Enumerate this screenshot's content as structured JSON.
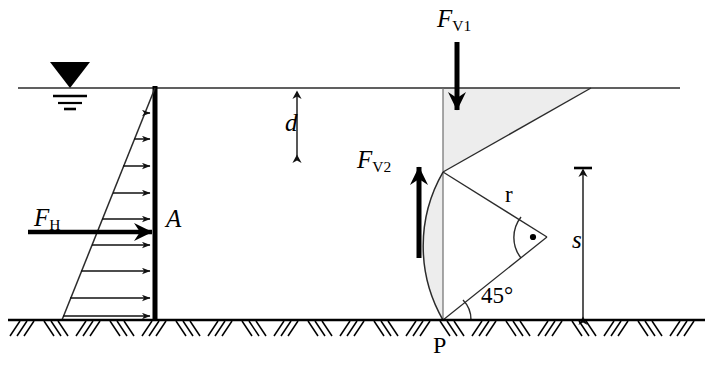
{
  "figure": {
    "type": "engineering-free-body-diagram",
    "colors": {
      "ink": "#000000",
      "thin_line": "#2b2b2b",
      "shade_fill": "#ededed",
      "background": "#ffffff"
    }
  },
  "labels": {
    "force_horizontal": {
      "base": "F",
      "sub": "H"
    },
    "force_vertical_1": {
      "base": "F",
      "sub": "V1"
    },
    "force_vertical_2": {
      "base": "F",
      "sub": "V2"
    },
    "point_a": "A",
    "point_p": "P",
    "radius": "r",
    "depth_d": "d",
    "depth_s": "s",
    "angle": "45°"
  },
  "geometry": {
    "water_surface_y": 88,
    "ground_y": 320,
    "wall_x": 155,
    "wall_top_y": 88,
    "wall_bottom_y": 320,
    "pressure_triangle_apex_x": 155,
    "pressure_triangle_base_left_x": 62,
    "pressure_arrow_count": 9,
    "pivot_p_x": 443,
    "arc_center_x": 443,
    "arc_center_y": 172,
    "arc_radius": 148,
    "angle_degrees": 45,
    "dim_d_x": 297,
    "dim_d_top_y": 90,
    "dim_d_bottom_y": 158,
    "dim_s_x": 583,
    "dim_s_top_y": 168,
    "dim_s_bottom_y": 318
  },
  "annotations": {
    "water_level_symbol": "free-surface-triangle-with-three-bars",
    "ground_symbol": "hatched-ground-line",
    "right_angle_symbol": "arc-with-center-dot"
  }
}
